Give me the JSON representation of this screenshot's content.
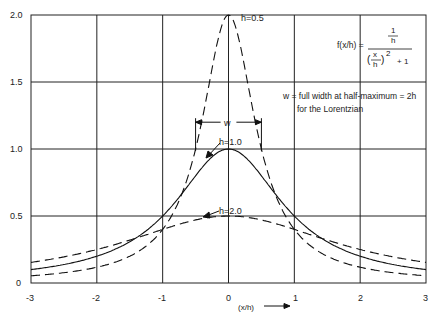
{
  "chart_data": {
    "type": "line",
    "title": "",
    "xlabel": "(x/h)",
    "ylabel": "",
    "xlim": [
      -3,
      3
    ],
    "ylim": [
      0,
      2.0
    ],
    "grid": true,
    "x_ticks": [
      "-3",
      "-2",
      "-1",
      "0",
      "1",
      "2",
      "3"
    ],
    "y_ticks": [
      "0",
      "0.5",
      "1.0",
      "1.5",
      "2.0"
    ],
    "formula": "f(x/h) = (1/h) / ((x/h)^2 + 1)",
    "series": [
      {
        "name": "h=0.5",
        "style": "dashed",
        "h": 0.5,
        "peak": 2.0
      },
      {
        "name": "h=1.0",
        "style": "solid",
        "h": 1.0,
        "peak": 1.0
      },
      {
        "name": "h=2.0",
        "style": "dashed",
        "h": 2.0,
        "peak": 0.5
      }
    ],
    "annotations": [
      "h=0.5",
      "h=1.0",
      "h=2.0",
      "w",
      "w = full width at half-maximum = 2h",
      "for the Lorentzian"
    ]
  },
  "labels": {
    "h05": "h=0.5",
    "h10": "h=1.0",
    "h20": "h=2.0",
    "w": "w",
    "fwhm_line1": "w = full width at half-maximum = 2h",
    "fwhm_line2": "for the Lorentzian",
    "formula_lhs": "f(x/h) =",
    "formula_num": "1",
    "formula_num_den": "h",
    "formula_x": "x",
    "formula_h": "h",
    "formula_rest": "+ 1",
    "xlabel": "(x/h)"
  },
  "ticks": {
    "x": [
      "-3",
      "-2",
      "-1",
      "0",
      "1",
      "2",
      "3"
    ],
    "y": [
      "0",
      "0.5",
      "1.0",
      "1.5",
      "2.0"
    ]
  }
}
